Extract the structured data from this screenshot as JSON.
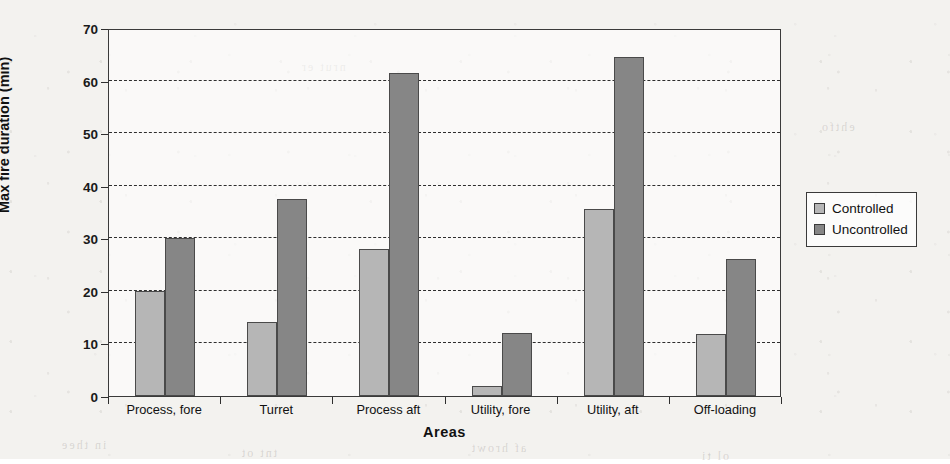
{
  "chart_data": {
    "type": "bar",
    "title": "",
    "subtitle": "",
    "xlabel": "Areas",
    "ylabel": "Max fire duration (min)",
    "categories": [
      "Process, fore",
      "Turret",
      "Process aft",
      "Utility, fore",
      "Utility, aft",
      "Off-loading"
    ],
    "series": [
      {
        "name": "Controlled",
        "color": "#b6b6b6",
        "values": [
          20,
          14,
          28,
          2,
          35.5,
          11.8
        ]
      },
      {
        "name": "Uncontrolled",
        "color": "#868686",
        "values": [
          30,
          37.5,
          61.5,
          12,
          64.5,
          26
        ]
      }
    ],
    "ylim": [
      0,
      70
    ],
    "yticks": [
      0,
      10,
      20,
      30,
      40,
      50,
      60,
      70
    ],
    "ytick_labels": [
      "0",
      "10",
      "20",
      "30",
      "40",
      "50",
      "60",
      "70"
    ],
    "grid": "horizontal-dashed",
    "legend_position": "right-outside",
    "bar_outline_color": "#4a4a4a",
    "axis_color": "#2e2e2e"
  },
  "legend": {
    "items": [
      {
        "label": "Controlled",
        "swatch": "controlled"
      },
      {
        "label": "Uncontrolled",
        "swatch": "uncontrolled"
      }
    ]
  },
  "page": {
    "bleed_marks": [
      "in thee",
      "tnt ot",
      "af hrowt",
      "ol ti",
      "ehtfo",
      "nrut er"
    ]
  }
}
